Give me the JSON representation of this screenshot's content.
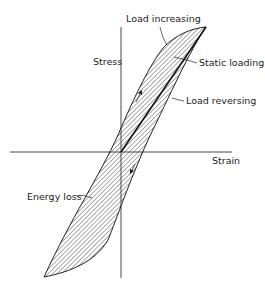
{
  "diagram": {
    "type": "stress-strain hysteresis loop",
    "axes": {
      "y_label": "Stress",
      "x_label": "Strain"
    },
    "annotations": {
      "load_increasing": "Load increasing",
      "static_loading": "Static loading",
      "load_reversing": "Load reversing",
      "energy_loss": "Energy loss"
    },
    "colors": {
      "ink": "#222222",
      "background": "#ffffff"
    }
  }
}
